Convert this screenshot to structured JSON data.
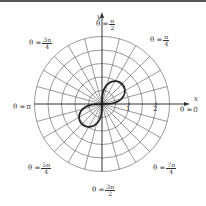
{
  "diagram": {
    "title": "",
    "type": "polar-graph",
    "curve": {
      "description": "lemniscate r^2 = sin(2θ)",
      "a": 1
    },
    "grid": {
      "circle_radii": [
        0.5,
        1,
        1.5,
        2,
        2.5
      ],
      "radial_line_step_deg": 15
    },
    "axes": {
      "x_label": "x",
      "y_label": "y"
    },
    "ticks": [
      {
        "label": "1",
        "value": 1
      },
      {
        "label": "2",
        "value": 2
      }
    ],
    "angle_labels": {
      "theta_0": {
        "prefix": "θ =",
        "value": "0"
      },
      "theta_pi_4": {
        "prefix": "θ =",
        "num": "π",
        "den": "4"
      },
      "theta_pi_2": {
        "prefix": "θ =",
        "num": "π",
        "den": "2"
      },
      "theta_3pi_4": {
        "prefix": "θ =",
        "num": "3π",
        "den": "4"
      },
      "theta_pi": {
        "prefix": "θ =",
        "value": "π"
      },
      "theta_5pi_4": {
        "prefix": "θ =",
        "num": "5π",
        "den": "4"
      },
      "theta_3pi_2": {
        "prefix": "θ =",
        "num": "3π",
        "den": "2"
      },
      "theta_7pi_4": {
        "prefix": "θ =",
        "num": "7π",
        "den": "4"
      }
    },
    "colors": {
      "grid": "#555555",
      "curve": "#222222",
      "text": "#333333"
    }
  }
}
